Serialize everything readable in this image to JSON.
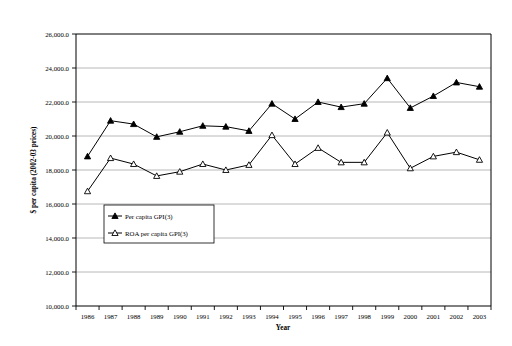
{
  "chart_data": {
    "type": "line",
    "title": "",
    "xlabel": "Year",
    "ylabel": "$ per capita (2002-03 prices)",
    "categories": [
      "1986",
      "1987",
      "1988",
      "1989",
      "1990",
      "1991",
      "1992",
      "1993",
      "1994",
      "1995",
      "1996",
      "1997",
      "1998",
      "1999",
      "2000",
      "2001",
      "2002",
      "2003"
    ],
    "x": [
      1986,
      1987,
      1988,
      1989,
      1990,
      1991,
      1992,
      1993,
      1994,
      1995,
      1996,
      1997,
      1998,
      1999,
      2000,
      2001,
      2002,
      2003
    ],
    "ylim": [
      10000,
      26000
    ],
    "ytick_labels": [
      "10,000.0",
      "12,000.0",
      "14,000.0",
      "16,000.0",
      "18,000.0",
      "20,000.0",
      "22,000.0",
      "24,000.0",
      "26,000.0"
    ],
    "ytick_values": [
      10000,
      12000,
      14000,
      16000,
      18000,
      20000,
      22000,
      24000,
      26000
    ],
    "grid": "horizontal",
    "legend_position": "inside-lower-left",
    "series": [
      {
        "name": "Per capita GPI(3)",
        "marker": "filled-triangle",
        "color": "#000000",
        "values": [
          18800,
          20900,
          20700,
          19950,
          20250,
          20600,
          20550,
          20300,
          21900,
          21000,
          22000,
          21700,
          21900,
          23400,
          21650,
          22350,
          23150,
          22900
        ]
      },
      {
        "name": "ROA per capita GPI(3)",
        "marker": "open-triangle",
        "color": "#000000",
        "values": [
          16750,
          18700,
          18350,
          17650,
          17900,
          18350,
          18000,
          18300,
          20050,
          18350,
          19300,
          18450,
          18450,
          20200,
          18100,
          18800,
          19050,
          18600
        ]
      }
    ]
  },
  "legend": {
    "entries": [
      {
        "label": "Per capita GPI(3)",
        "marker": "filled-triangle"
      },
      {
        "label": "ROA per capita GPI(3)",
        "marker": "open-triangle"
      }
    ]
  },
  "axes": {
    "y_title": "$ per capita (2002-03 prices)",
    "x_title": "Year"
  },
  "colors": {
    "line": "#000000",
    "grid": "#a6a6a6",
    "frame": "#000000",
    "background": "#ffffff"
  }
}
